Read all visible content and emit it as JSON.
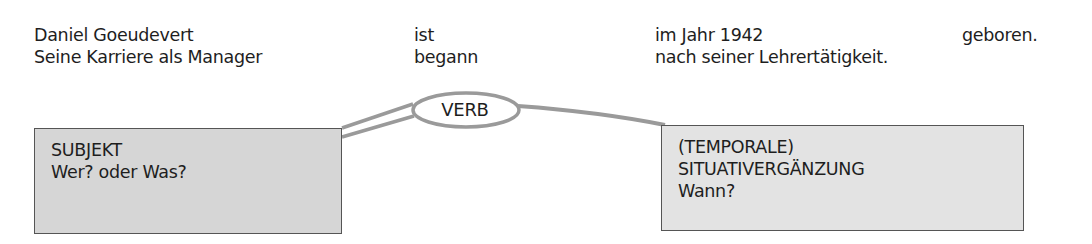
{
  "sentences": [
    {
      "subject": "Daniel Goeudevert",
      "verb": "ist",
      "complement": "im Jahr 1942",
      "end": "geboren."
    },
    {
      "subject": "Seine Karriere als Manager",
      "verb": "begann",
      "complement": "nach seiner Lehrertätigkeit.",
      "end": ""
    }
  ],
  "verb_node": {
    "label": "VERB"
  },
  "boxes": {
    "subject": {
      "title": "SUBJEKT",
      "question": "Wer? oder Was?"
    },
    "temporal": {
      "title_line1": "(TEMPORALE)",
      "title_line2": "SITUATIVERGÄNZUNG",
      "question": "Wann?"
    }
  },
  "colors": {
    "connector": "#9a9a9a",
    "box_border": "#555555",
    "box_fill_subject": "#d6d6d6",
    "box_fill_temporal": "#e3e3e3",
    "text": "#1e1e1e"
  }
}
